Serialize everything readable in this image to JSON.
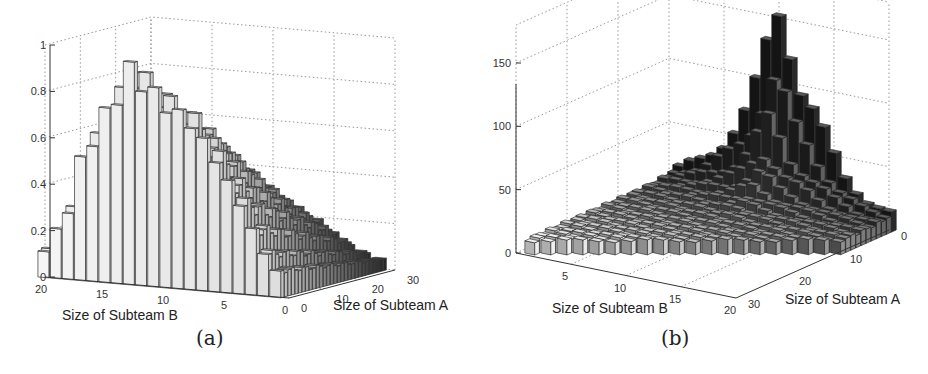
{
  "chart_data": [
    {
      "id": "a",
      "type": "bar3d",
      "caption": "(a)",
      "xlabel": "Size of Subteam B",
      "ylabel": "Size of Subteam A",
      "zlabel": "",
      "x_ticks": [
        "20",
        "15",
        "10",
        "5",
        "0"
      ],
      "y_ticks": [
        "0",
        "10",
        "20",
        "30"
      ],
      "z_ticks": [
        "0",
        "0.2",
        "0.4",
        "0.6",
        "0.8",
        "1"
      ],
      "zlim": [
        0,
        1
      ],
      "x_range": [
        0,
        20
      ],
      "y_range": [
        0,
        30
      ],
      "grid": true,
      "description": "Triangular region (A + B <= ~30). Values highest (~1.0) near B≈13, A≈2; decreasing toward large A and small B; near 0 at B=0.",
      "peak": {
        "B": 13,
        "A": 2,
        "value": 1.0
      },
      "profile_along_B_at_A0": [
        {
          "B": 20,
          "value": 0.13
        },
        {
          "B": 19,
          "value": 0.22
        },
        {
          "B": 18,
          "value": 0.33
        },
        {
          "B": 17,
          "value": 0.55
        },
        {
          "B": 16,
          "value": 0.67
        },
        {
          "B": 15,
          "value": 0.78
        },
        {
          "B": 14,
          "value": 0.88
        },
        {
          "B": 13,
          "value": 1.0
        },
        {
          "B": 12,
          "value": 0.95
        },
        {
          "B": 11,
          "value": 0.9
        },
        {
          "B": 10,
          "value": 0.85
        },
        {
          "B": 8,
          "value": 0.78
        },
        {
          "B": 6,
          "value": 0.62
        },
        {
          "B": 4,
          "value": 0.42
        },
        {
          "B": 2,
          "value": 0.2
        },
        {
          "B": 0,
          "value": 0.05
        }
      ]
    },
    {
      "id": "b",
      "type": "bar3d",
      "caption": "(b)",
      "xlabel": "Size of Subteam B",
      "ylabel": "Size of Subteam A",
      "zlabel": "",
      "x_ticks": [
        "5",
        "10",
        "15",
        "20"
      ],
      "y_ticks": [
        "0",
        "10",
        "20",
        "30"
      ],
      "z_ticks": [
        "0",
        "50",
        "100",
        "150"
      ],
      "zlim": [
        0,
        180
      ],
      "x_range": [
        1,
        20
      ],
      "y_range": [
        0,
        30
      ],
      "grid": true,
      "description": "Sharp peak (~180) at small A near B≈10; values fall quickly to ~10-20 across the rest of the triangular domain.",
      "peak": {
        "B": 10,
        "A": 0,
        "value": 180
      },
      "profile_along_B_at_A0": [
        {
          "B": 1,
          "value": 18
        },
        {
          "B": 2,
          "value": 24
        },
        {
          "B": 3,
          "value": 30
        },
        {
          "B": 4,
          "value": 38
        },
        {
          "B": 5,
          "value": 48
        },
        {
          "B": 6,
          "value": 60
        },
        {
          "B": 7,
          "value": 75
        },
        {
          "B": 8,
          "value": 100
        },
        {
          "B": 9,
          "value": 140
        },
        {
          "B": 10,
          "value": 180
        },
        {
          "B": 11,
          "value": 150
        },
        {
          "B": 12,
          "value": 110
        },
        {
          "B": 13,
          "value": 90
        },
        {
          "B": 14,
          "value": 72
        },
        {
          "B": 15,
          "value": 55
        },
        {
          "B": 16,
          "value": 40
        },
        {
          "B": 17,
          "value": 30
        },
        {
          "B": 18,
          "value": 22
        },
        {
          "B": 19,
          "value": 18
        },
        {
          "B": 20,
          "value": 16
        }
      ]
    }
  ],
  "panels": {
    "a": {
      "caption": "(a)",
      "xlabel": "Size of Subteam B",
      "ylabel": "Size of Subteam A"
    },
    "b": {
      "caption": "(b)",
      "xlabel": "Size of Subteam B",
      "ylabel": "Size of Subteam A"
    }
  }
}
